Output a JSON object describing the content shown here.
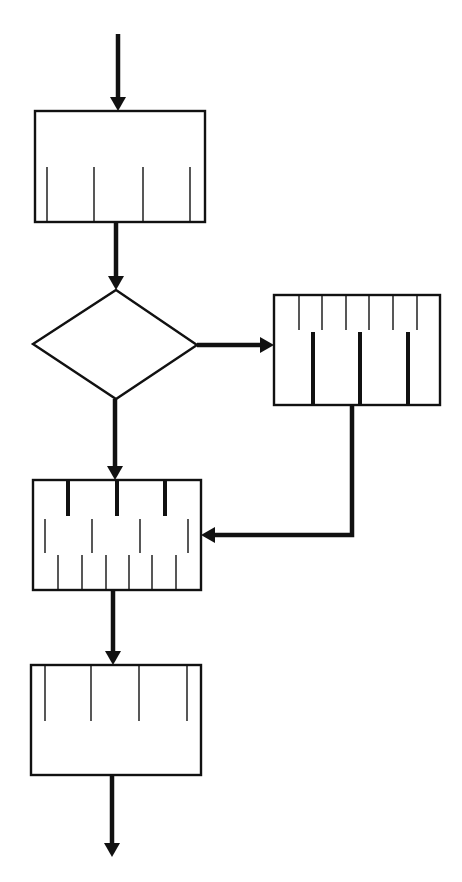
{
  "diagram": {
    "type": "flowchart",
    "stroke_color": "#111111",
    "background": "#ffffff",
    "nodes": [
      {
        "id": "process-1",
        "shape": "rect",
        "x": 35,
        "y": 111,
        "w": 170,
        "h": 111,
        "ticks": [
          {
            "style": "thin",
            "xs": [
              47,
              94,
              143,
              190
            ],
            "y1": 167,
            "y2": 222
          }
        ]
      },
      {
        "id": "decision",
        "shape": "diamond",
        "points": [
          [
            116,
            290
          ],
          [
            197,
            345
          ],
          [
            116,
            399
          ],
          [
            33,
            344
          ]
        ]
      },
      {
        "id": "process-branch",
        "shape": "rect",
        "x": 274,
        "y": 295,
        "w": 166,
        "h": 110,
        "ticks": [
          {
            "style": "thin",
            "xs": [
              299,
              322,
              346,
              369,
              393,
              417
            ],
            "y1": 295,
            "y2": 330
          },
          {
            "style": "thick",
            "xs": [
              313,
              360,
              408
            ],
            "y1": 332,
            "y2": 405
          }
        ]
      },
      {
        "id": "process-merge",
        "shape": "rect",
        "x": 33,
        "y": 480,
        "w": 168,
        "h": 110,
        "ticks": [
          {
            "style": "thick",
            "xs": [
              68,
              117,
              165
            ],
            "y1": 480,
            "y2": 516
          },
          {
            "style": "thin",
            "xs": [
              45,
              92,
              140,
              188
            ],
            "y1": 519,
            "y2": 553
          },
          {
            "style": "thin",
            "xs": [
              58,
              82,
              106,
              129,
              152,
              176
            ],
            "y1": 555,
            "y2": 590
          }
        ]
      },
      {
        "id": "process-final",
        "shape": "rect",
        "x": 31,
        "y": 665,
        "w": 170,
        "h": 110,
        "ticks": [
          {
            "style": "thin",
            "xs": [
              45,
              91,
              139,
              187
            ],
            "y1": 665,
            "y2": 721
          }
        ]
      }
    ],
    "edges": [
      {
        "id": "entry-arrow",
        "points": [
          [
            118,
            34
          ],
          [
            118,
            111
          ]
        ],
        "dir": "down"
      },
      {
        "id": "process1-to-decision",
        "points": [
          [
            116,
            222
          ],
          [
            116,
            290
          ]
        ],
        "dir": "down"
      },
      {
        "id": "decision-to-branch",
        "points": [
          [
            197,
            345
          ],
          [
            274,
            345
          ]
        ],
        "dir": "right"
      },
      {
        "id": "decision-to-merge",
        "points": [
          [
            115,
            399
          ],
          [
            115,
            480
          ]
        ],
        "dir": "down"
      },
      {
        "id": "branch-to-merge",
        "points": [
          [
            352,
            405
          ],
          [
            352,
            535
          ],
          [
            201,
            535
          ]
        ],
        "dir": "left"
      },
      {
        "id": "merge-to-final",
        "points": [
          [
            113,
            590
          ],
          [
            113,
            665
          ]
        ],
        "dir": "down"
      },
      {
        "id": "exit-arrow",
        "points": [
          [
            112,
            775
          ],
          [
            112,
            857
          ]
        ],
        "dir": "down"
      }
    ]
  }
}
